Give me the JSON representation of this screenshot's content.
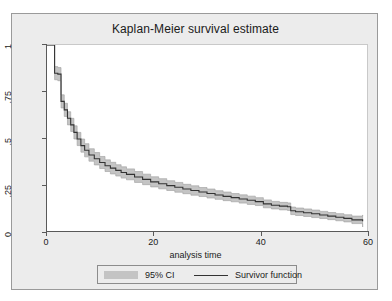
{
  "chart_data": {
    "type": "line",
    "title": "Kaplan-Meier survival estimate",
    "xlabel": "analysis time",
    "ylabel": "",
    "xlim": [
      0,
      60
    ],
    "ylim": [
      0,
      1
    ],
    "grid": false,
    "legend_position": "bottom",
    "xticks": [
      0,
      20,
      40,
      60
    ],
    "xtick_labels": [
      "0",
      "20",
      "40",
      "60"
    ],
    "yticks": [
      0,
      0.25,
      0.5,
      0.75,
      1
    ],
    "ytick_labels": [
      "0",
      ".25",
      ".5",
      ".75",
      "1"
    ],
    "legend": [
      {
        "label": "95% CI",
        "marker": "band",
        "color": "#c4c4c4"
      },
      {
        "label": "Survivor function",
        "marker": "line",
        "color": "#333333"
      }
    ],
    "series": [
      {
        "name": "Survivor function",
        "style": "step",
        "color": "#333333",
        "x": [
          0,
          1.0,
          1.6,
          2.2,
          2.8,
          3.4,
          4.0,
          4.6,
          5.2,
          5.8,
          6.5,
          7.2,
          8.0,
          9.0,
          10.0,
          11.0,
          12.0,
          13.0,
          14.0,
          15.0,
          16.5,
          18.0,
          19.5,
          21.0,
          22.5,
          24.0,
          25.5,
          27.0,
          28.5,
          30.0,
          31.5,
          33.0,
          34.5,
          36.0,
          37.5,
          39.0,
          40.5,
          42.0,
          43.5,
          45.0,
          45.6,
          46.5,
          48.0,
          49.5,
          51.0,
          52.5,
          54.0,
          55.5,
          57.0,
          59.0
        ],
        "y": [
          1.0,
          1.0,
          0.85,
          0.845,
          0.7,
          0.655,
          0.61,
          0.575,
          0.535,
          0.5,
          0.465,
          0.44,
          0.415,
          0.395,
          0.375,
          0.358,
          0.345,
          0.333,
          0.322,
          0.312,
          0.298,
          0.285,
          0.272,
          0.262,
          0.252,
          0.243,
          0.234,
          0.226,
          0.218,
          0.21,
          0.202,
          0.195,
          0.188,
          0.181,
          0.174,
          0.167,
          0.155,
          0.148,
          0.143,
          0.14,
          0.118,
          0.113,
          0.108,
          0.102,
          0.096,
          0.09,
          0.084,
          0.078,
          0.07,
          0.062
        ]
      }
    ],
    "confidence_band": {
      "name": "95% CI",
      "color": "#c4c4c4",
      "level": 0.95,
      "x": [
        0,
        1.0,
        1.6,
        2.2,
        2.8,
        3.4,
        4.0,
        4.6,
        5.2,
        5.8,
        6.5,
        7.2,
        8.0,
        9.0,
        10.0,
        11.0,
        12.0,
        13.0,
        14.0,
        15.0,
        16.5,
        18.0,
        19.5,
        21.0,
        22.5,
        24.0,
        25.5,
        27.0,
        28.5,
        30.0,
        31.5,
        33.0,
        34.5,
        36.0,
        37.5,
        39.0,
        40.5,
        42.0,
        43.5,
        45.0,
        45.6,
        46.5,
        48.0,
        49.5,
        51.0,
        52.5,
        54.0,
        55.5,
        57.0,
        59.0
      ],
      "lower": [
        1.0,
        1.0,
        0.815,
        0.81,
        0.665,
        0.62,
        0.575,
        0.54,
        0.5,
        0.465,
        0.43,
        0.405,
        0.382,
        0.362,
        0.343,
        0.327,
        0.314,
        0.303,
        0.292,
        0.283,
        0.269,
        0.257,
        0.245,
        0.235,
        0.226,
        0.217,
        0.209,
        0.201,
        0.194,
        0.186,
        0.179,
        0.172,
        0.166,
        0.159,
        0.152,
        0.146,
        0.134,
        0.128,
        0.123,
        0.12,
        0.098,
        0.093,
        0.088,
        0.082,
        0.077,
        0.071,
        0.065,
        0.059,
        0.05,
        0.032
      ],
      "upper": [
        1.0,
        1.0,
        0.885,
        0.88,
        0.735,
        0.69,
        0.645,
        0.61,
        0.57,
        0.535,
        0.5,
        0.475,
        0.448,
        0.428,
        0.407,
        0.389,
        0.376,
        0.363,
        0.352,
        0.341,
        0.327,
        0.313,
        0.299,
        0.289,
        0.278,
        0.269,
        0.259,
        0.251,
        0.242,
        0.234,
        0.225,
        0.218,
        0.21,
        0.203,
        0.196,
        0.188,
        0.176,
        0.168,
        0.163,
        0.16,
        0.138,
        0.133,
        0.128,
        0.122,
        0.115,
        0.109,
        0.103,
        0.097,
        0.09,
        0.096
      ]
    }
  }
}
